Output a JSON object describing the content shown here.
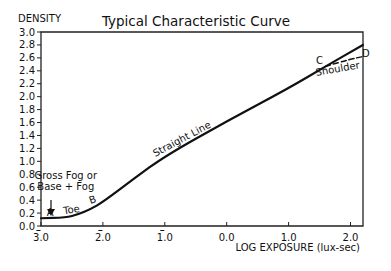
{
  "chart_data": {
    "type": "line",
    "title": "Typical Characteristic Curve",
    "xlabel": "LOG EXPOSURE (lux-sec)",
    "ylabel": "DENSITY",
    "xlim": [
      -3.0,
      2.2
    ],
    "ylim": [
      0.0,
      3.0
    ],
    "grid": false,
    "x_ticks": [
      {
        "value": -3.0,
        "label": "3.0",
        "bar": true
      },
      {
        "value": -2.0,
        "label": "2.0",
        "bar": true
      },
      {
        "value": -1.0,
        "label": "1.0",
        "bar": true
      },
      {
        "value": 0.0,
        "label": "0.0",
        "bar": false
      },
      {
        "value": 1.0,
        "label": "1.0",
        "bar": false
      },
      {
        "value": 2.0,
        "label": "2.0",
        "bar": false
      }
    ],
    "y_ticks": [
      "0.0",
      "0.2",
      "0.4",
      "0.6",
      "0.8",
      "1.0",
      "1.2",
      "1.4",
      "1.6",
      "1.8",
      "2.0",
      "2.2",
      "2.4",
      "2.6",
      "2.8",
      "3.0"
    ],
    "series": [
      {
        "name": "Characteristic curve",
        "style": "solid",
        "x": [
          -3.0,
          -2.6,
          -2.4,
          -2.2,
          -2.0,
          -1.5,
          -1.0,
          0.0,
          1.0,
          1.6,
          2.2
        ],
        "y": [
          0.12,
          0.13,
          0.18,
          0.26,
          0.37,
          0.73,
          1.08,
          1.62,
          2.13,
          2.47,
          2.8
        ]
      },
      {
        "name": "Shoulder",
        "style": "dashed",
        "x": [
          1.6,
          2.0,
          2.2
        ],
        "y": [
          2.47,
          2.58,
          2.62
        ]
      }
    ],
    "annotations": [
      {
        "text": "A",
        "x": -2.85,
        "y": 0.15
      },
      {
        "text": "Toe",
        "x": -2.5,
        "y": 0.2
      },
      {
        "text": "B",
        "x": -2.15,
        "y": 0.36
      },
      {
        "text": "Straight Line",
        "x": -0.7,
        "y": 1.3
      },
      {
        "text": "C",
        "x": 1.5,
        "y": 2.5
      },
      {
        "text": "Shoulder",
        "x": 1.8,
        "y": 2.38
      },
      {
        "text": "D",
        "x": 2.25,
        "y": 2.62
      },
      {
        "text": "Gross Fog or",
        "x": -2.6,
        "y": 0.72
      },
      {
        "text": "Base + Fog",
        "x": -2.6,
        "y": 0.56
      }
    ]
  }
}
